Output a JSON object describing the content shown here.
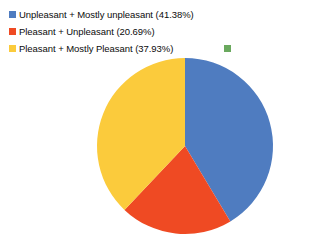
{
  "chart_data": {
    "type": "pie",
    "title": "",
    "legend_position": "top",
    "total_responses": 29,
    "categories": [
      "Unpleasant + Mostly unpleasant",
      "Pleasant + Unpleasant",
      "Pleasant + Mostly Pleasant",
      ""
    ],
    "values": [
      41.38,
      20.69,
      37.93,
      0
    ],
    "value_unit": "%",
    "colors": [
      "#4f7cc0",
      "#ef4a23",
      "#fbcb3c",
      "#6aa95e"
    ],
    "start_angle_deg": 0,
    "direction": "clockwise",
    "slices": [
      {
        "label": "Unpleasant + Mostly unpleasant",
        "legend_text": "Unpleasant + Mostly unpleasant (41.38%)",
        "value": 41.38,
        "color": "#4f7cc0",
        "swatch_name": "blue"
      },
      {
        "label": "Pleasant + Unpleasant",
        "legend_text": "Pleasant + Unpleasant (20.69%)",
        "value": 20.69,
        "color": "#ef4a23",
        "swatch_name": "red"
      },
      {
        "label": "Pleasant + Mostly Pleasant",
        "legend_text": "Pleasant + Mostly Pleasant (37.93%)",
        "value": 37.93,
        "color": "#fbcb3c",
        "swatch_name": "yellow"
      },
      {
        "label": "",
        "legend_text": "",
        "value": 0,
        "color": "#6aa95e",
        "swatch_name": "green"
      }
    ]
  },
  "legend": {
    "items": [
      {
        "text": "Unpleasant + Mostly unpleasant (41.38%)",
        "color": "#4f7cc0"
      },
      {
        "text": "Pleasant + Unpleasant (20.69%)",
        "color": "#ef4a23"
      },
      {
        "text": "Pleasant + Mostly Pleasant (37.93%)",
        "color": "#fbcb3c"
      },
      {
        "text": "",
        "color": "#6aa95e"
      }
    ]
  },
  "background_color": "#ffffff"
}
